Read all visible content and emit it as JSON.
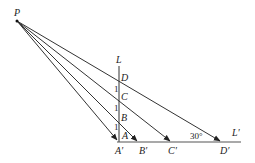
{
  "diagram": {
    "points": {
      "P": {
        "label": "P",
        "x": 17,
        "y": 21
      },
      "L": {
        "label": "L",
        "x": 119,
        "y": 65
      },
      "D": {
        "label": "D",
        "x": 119,
        "y": 78
      },
      "C": {
        "label": "C",
        "x": 119,
        "y": 97
      },
      "B": {
        "label": "B",
        "x": 119,
        "y": 117
      },
      "A": {
        "label": "A",
        "x": 119,
        "y": 135
      },
      "A_prime": {
        "label": "A′",
        "x": 119,
        "y": 142
      },
      "B_prime": {
        "label": "B′",
        "x": 139,
        "y": 142
      },
      "C_prime": {
        "label": "C′",
        "x": 172,
        "y": 142
      },
      "D_prime": {
        "label": "D′",
        "x": 222,
        "y": 142
      },
      "L_prime": {
        "label": "L′",
        "x": 240,
        "y": 142
      }
    },
    "segment_labels": [
      "1",
      "1",
      "1"
    ],
    "angle_label": "30°",
    "line_labels": {
      "vertical": "L",
      "horizontal": "L′"
    }
  }
}
